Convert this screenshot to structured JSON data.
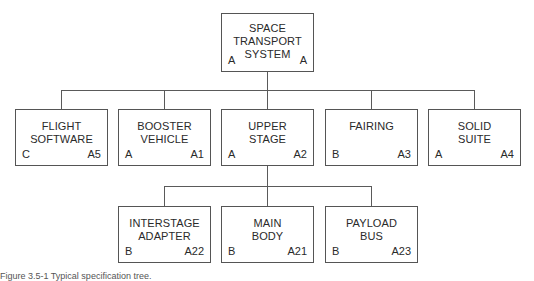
{
  "diagram": {
    "type": "specification-tree",
    "root": {
      "title": "SPACE\nTRANSPORT\nSYSTEM",
      "spec_class": "A",
      "id": "A"
    },
    "level1": [
      {
        "title": "FLIGHT\nSOFTWARE",
        "spec_class": "C",
        "id": "A5"
      },
      {
        "title": "BOOSTER\nVEHICLE",
        "spec_class": "A",
        "id": "A1"
      },
      {
        "title": "UPPER\nSTAGE",
        "spec_class": "A",
        "id": "A2"
      },
      {
        "title": "FAIRING",
        "spec_class": "B",
        "id": "A3"
      },
      {
        "title": "SOLID\nSUITE",
        "spec_class": "A",
        "id": "A4"
      }
    ],
    "level2_parent": "UPPER STAGE",
    "level2": [
      {
        "title": "INTERSTAGE\nADAPTER",
        "spec_class": "B",
        "id": "A22"
      },
      {
        "title": "MAIN\nBODY",
        "spec_class": "B",
        "id": "A21"
      },
      {
        "title": "PAYLOAD\nBUS",
        "spec_class": "B",
        "id": "A23"
      }
    ]
  },
  "caption": "Figure 3.5-1   Typical specification tree."
}
